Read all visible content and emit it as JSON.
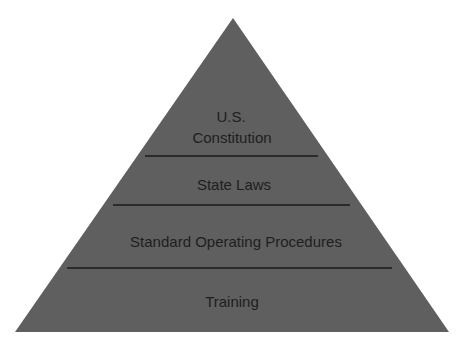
{
  "diagram": {
    "type": "pyramid",
    "fill_color": "#5f5f5f",
    "line_color": "#1a1a1a",
    "text_color": "#1e1e1e",
    "levels": [
      {
        "line1": "U.S.",
        "line2": "Constitution"
      },
      {
        "label": "State Laws"
      },
      {
        "label": "Standard Operating Procedures"
      },
      {
        "label": "Training"
      }
    ]
  }
}
